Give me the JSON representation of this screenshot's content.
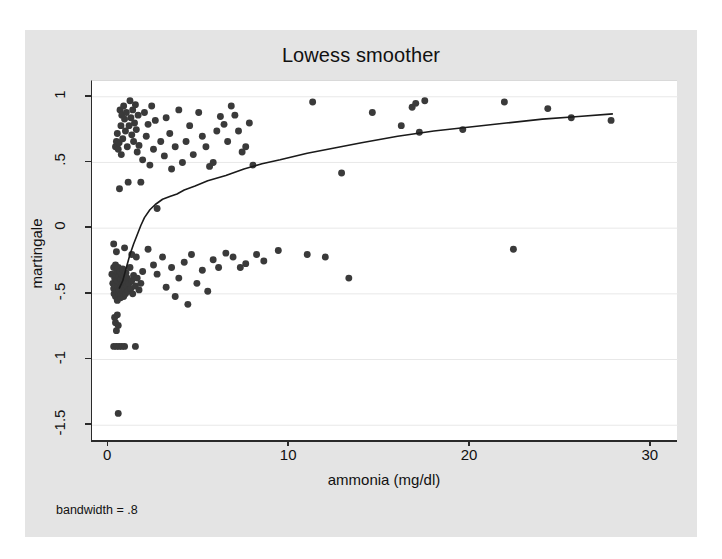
{
  "chart_data": {
    "type": "scatter",
    "title": "Lowess smoother",
    "xlabel": "ammonia (mg/dl)",
    "ylabel": "martingale",
    "note": "bandwidth = .8",
    "xlim": [
      -0.9,
      31.5
    ],
    "ylim": [
      -1.62,
      1.12
    ],
    "xticks": [
      0,
      10,
      20,
      30
    ],
    "xtick_labels": [
      "0",
      "10",
      "20",
      "30"
    ],
    "yticks": [
      1,
      0.5,
      0,
      -0.5,
      -1,
      -1.5
    ],
    "ytick_labels": [
      "1",
      ".5",
      "0",
      "-.5",
      "-1",
      "-1.5"
    ],
    "grid": "horizontal",
    "grid_color": "#e8e8e8",
    "marker_color": "#3a3a3a",
    "marker_size": 6.5,
    "line_color": "#1a1a1a",
    "line_width": 1.6,
    "legend": "none",
    "series": [
      {
        "name": "martingale residuals",
        "type": "scatter",
        "points": [
          [
            0.55,
            -1.41
          ],
          [
            0.4,
            0.62
          ],
          [
            0.45,
            0.66
          ],
          [
            0.5,
            0.72
          ],
          [
            0.55,
            0.6
          ],
          [
            0.6,
            0.65
          ],
          [
            0.62,
            0.3
          ],
          [
            0.65,
            0.9
          ],
          [
            0.7,
            0.78
          ],
          [
            0.72,
            0.56
          ],
          [
            0.75,
            0.86
          ],
          [
            0.8,
            0.68
          ],
          [
            0.85,
            0.93
          ],
          [
            0.9,
            0.83
          ],
          [
            0.95,
            0.74
          ],
          [
            1.0,
            0.88
          ],
          [
            1.05,
            0.62
          ],
          [
            1.1,
            0.35
          ],
          [
            1.15,
            0.78
          ],
          [
            1.2,
            0.97
          ],
          [
            1.25,
            0.84
          ],
          [
            1.3,
            0.71
          ],
          [
            1.35,
            0.9
          ],
          [
            1.4,
            0.66
          ],
          [
            1.45,
            0.8
          ],
          [
            1.5,
            0.94
          ],
          [
            1.55,
            0.75
          ],
          [
            1.6,
            0.58
          ],
          [
            1.65,
            0.86
          ],
          [
            1.7,
            0.63
          ],
          [
            1.8,
            0.35
          ],
          [
            1.9,
            0.52
          ],
          [
            2.0,
            0.88
          ],
          [
            2.1,
            0.7
          ],
          [
            2.2,
            0.79
          ],
          [
            2.3,
            0.48
          ],
          [
            2.4,
            0.93
          ],
          [
            2.5,
            0.6
          ],
          [
            2.6,
            0.82
          ],
          [
            2.7,
            0.15
          ],
          [
            2.9,
            0.66
          ],
          [
            3.1,
            0.55
          ],
          [
            3.2,
            0.84
          ],
          [
            3.4,
            0.72
          ],
          [
            3.5,
            0.45
          ],
          [
            3.7,
            0.62
          ],
          [
            3.9,
            0.9
          ],
          [
            4.1,
            0.5
          ],
          [
            4.3,
            0.66
          ],
          [
            4.5,
            0.78
          ],
          [
            4.7,
            0.56
          ],
          [
            5.0,
            0.88
          ],
          [
            5.2,
            0.7
          ],
          [
            5.4,
            0.62
          ],
          [
            5.6,
            0.47
          ],
          [
            5.8,
            0.5
          ],
          [
            6.0,
            0.74
          ],
          [
            6.2,
            0.85
          ],
          [
            6.4,
            0.79
          ],
          [
            6.6,
            0.66
          ],
          [
            6.8,
            0.93
          ],
          [
            7.0,
            0.86
          ],
          [
            7.2,
            0.74
          ],
          [
            7.4,
            0.58
          ],
          [
            7.6,
            0.62
          ],
          [
            7.8,
            0.8
          ],
          [
            8.0,
            0.48
          ],
          [
            11.3,
            0.96
          ],
          [
            12.9,
            0.42
          ],
          [
            14.6,
            0.88
          ],
          [
            16.2,
            0.78
          ],
          [
            16.8,
            0.92
          ],
          [
            17.0,
            0.95
          ],
          [
            17.2,
            0.73
          ],
          [
            17.5,
            0.97
          ],
          [
            19.6,
            0.75
          ],
          [
            21.9,
            0.96
          ],
          [
            24.3,
            0.91
          ],
          [
            25.6,
            0.84
          ],
          [
            27.8,
            0.82
          ],
          [
            0.2,
            -0.35
          ],
          [
            0.25,
            -0.42
          ],
          [
            0.3,
            -0.3
          ],
          [
            0.3,
            -0.46
          ],
          [
            0.32,
            -0.5
          ],
          [
            0.35,
            -0.38
          ],
          [
            0.38,
            -0.44
          ],
          [
            0.4,
            -0.28
          ],
          [
            0.4,
            -0.52
          ],
          [
            0.42,
            -0.36
          ],
          [
            0.45,
            -0.48
          ],
          [
            0.48,
            -0.33
          ],
          [
            0.5,
            -0.4
          ],
          [
            0.5,
            -0.55
          ],
          [
            0.52,
            -0.45
          ],
          [
            0.55,
            -0.3
          ],
          [
            0.58,
            -0.5
          ],
          [
            0.6,
            -0.37
          ],
          [
            0.6,
            -0.47
          ],
          [
            0.62,
            -0.42
          ],
          [
            0.65,
            -0.33
          ],
          [
            0.68,
            -0.53
          ],
          [
            0.7,
            -0.39
          ],
          [
            0.7,
            -0.45
          ],
          [
            0.72,
            -0.5
          ],
          [
            0.75,
            -0.35
          ],
          [
            0.78,
            -0.43
          ],
          [
            0.8,
            -0.31
          ],
          [
            0.8,
            -0.48
          ],
          [
            0.82,
            -0.4
          ],
          [
            0.85,
            -0.52
          ],
          [
            0.88,
            -0.36
          ],
          [
            0.9,
            -0.46
          ],
          [
            0.92,
            -0.41
          ],
          [
            0.95,
            -0.5
          ],
          [
            0.98,
            -0.34
          ],
          [
            1.0,
            -0.44
          ],
          [
            1.05,
            -0.38
          ],
          [
            1.1,
            -0.48
          ],
          [
            1.15,
            -0.42
          ],
          [
            1.2,
            -0.3
          ],
          [
            1.25,
            -0.46
          ],
          [
            1.3,
            -0.4
          ],
          [
            1.35,
            -0.5
          ],
          [
            1.4,
            -0.36
          ],
          [
            1.5,
            -0.44
          ],
          [
            1.6,
            -0.38
          ],
          [
            1.7,
            -0.47
          ],
          [
            1.8,
            -0.42
          ],
          [
            1.9,
            -0.33
          ],
          [
            0.3,
            -0.12
          ],
          [
            0.45,
            -0.18
          ],
          [
            0.9,
            -0.15
          ],
          [
            1.3,
            -0.2
          ],
          [
            1.55,
            -0.22
          ],
          [
            0.35,
            -0.68
          ],
          [
            0.5,
            -0.66
          ],
          [
            0.4,
            -0.72
          ],
          [
            0.55,
            -0.74
          ],
          [
            0.45,
            -0.78
          ],
          [
            0.3,
            -0.9
          ],
          [
            0.45,
            -0.9
          ],
          [
            0.6,
            -0.9
          ],
          [
            0.75,
            -0.9
          ],
          [
            0.9,
            -0.9
          ],
          [
            1.5,
            -0.9
          ],
          [
            2.2,
            -0.16
          ],
          [
            2.5,
            -0.28
          ],
          [
            2.7,
            -0.35
          ],
          [
            3.0,
            -0.22
          ],
          [
            3.2,
            -0.45
          ],
          [
            3.5,
            -0.3
          ],
          [
            3.7,
            -0.52
          ],
          [
            3.9,
            -0.38
          ],
          [
            4.2,
            -0.26
          ],
          [
            4.4,
            -0.58
          ],
          [
            4.6,
            -0.2
          ],
          [
            4.9,
            -0.42
          ],
          [
            5.2,
            -0.32
          ],
          [
            5.5,
            -0.48
          ],
          [
            5.8,
            -0.24
          ],
          [
            6.1,
            -0.3
          ],
          [
            6.5,
            -0.19
          ],
          [
            6.9,
            -0.22
          ],
          [
            7.3,
            -0.3
          ],
          [
            7.6,
            -0.27
          ],
          [
            8.2,
            -0.2
          ],
          [
            8.6,
            -0.25
          ],
          [
            9.4,
            -0.17
          ],
          [
            11.0,
            -0.2
          ],
          [
            12.0,
            -0.22
          ],
          [
            13.3,
            -0.38
          ],
          [
            22.4,
            -0.16
          ]
        ]
      },
      {
        "name": "lowess smooth",
        "type": "line",
        "points": [
          [
            0.6,
            -0.46
          ],
          [
            0.8,
            -0.4
          ],
          [
            1.0,
            -0.3
          ],
          [
            1.2,
            -0.2
          ],
          [
            1.4,
            -0.12
          ],
          [
            1.6,
            -0.05
          ],
          [
            1.8,
            0.02
          ],
          [
            2.0,
            0.08
          ],
          [
            2.3,
            0.14
          ],
          [
            2.6,
            0.18
          ],
          [
            3.0,
            0.22
          ],
          [
            3.4,
            0.24
          ],
          [
            3.8,
            0.26
          ],
          [
            4.2,
            0.29
          ],
          [
            4.8,
            0.32
          ],
          [
            5.5,
            0.36
          ],
          [
            6.5,
            0.4
          ],
          [
            7.5,
            0.45
          ],
          [
            8.5,
            0.49
          ],
          [
            9.5,
            0.52
          ],
          [
            11.0,
            0.57
          ],
          [
            12.5,
            0.61
          ],
          [
            14.0,
            0.65
          ],
          [
            16.0,
            0.7
          ],
          [
            18.0,
            0.74
          ],
          [
            20.0,
            0.77
          ],
          [
            22.0,
            0.8
          ],
          [
            24.0,
            0.83
          ],
          [
            26.0,
            0.85
          ],
          [
            27.9,
            0.87
          ]
        ]
      }
    ]
  },
  "axis": {
    "xlabel": "ammonia (mg/dl)",
    "ylabel": "martingale"
  },
  "title": "Lowess smoother",
  "note": "bandwidth = .8"
}
